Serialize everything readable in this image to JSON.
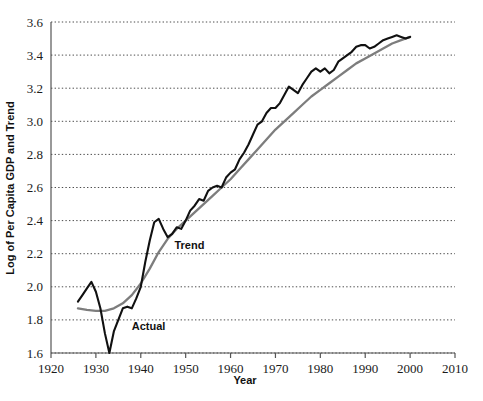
{
  "chart_data": {
    "type": "line",
    "title": "",
    "xlabel": "Year",
    "ylabel": "Log of Per Capita GDP and Trend",
    "xlim": [
      1920,
      2010
    ],
    "ylim": [
      1.6,
      3.6
    ],
    "xticks": [
      1920,
      1930,
      1940,
      1950,
      1960,
      1970,
      1980,
      1990,
      2000,
      2010
    ],
    "yticks": [
      1.6,
      1.8,
      2.0,
      2.2,
      2.4,
      2.6,
      2.8,
      3.0,
      3.2,
      3.4,
      3.6
    ],
    "xtick_labels": [
      "1920",
      "1930",
      "1940",
      "1950",
      "1960",
      "1970",
      "1980",
      "1990",
      "2000",
      "2010"
    ],
    "ytick_labels": [
      "1.6",
      "1.8",
      "2.0",
      "2.2",
      "2.4",
      "2.6",
      "2.8",
      "3.0",
      "3.2",
      "3.4",
      "3.6"
    ],
    "grid": true,
    "grid_axis": "y",
    "legend_position": "inline-annotation",
    "colors": {
      "actual": "#111111",
      "trend": "#7d7d7d",
      "grid": "#4d4d4d",
      "axis": "#555555"
    },
    "annotations": [
      {
        "name": "trend-label",
        "text": "Trend",
        "x": 1947.5,
        "y": 2.23
      },
      {
        "name": "actual-label",
        "text": "Actual",
        "x": 1938.0,
        "y": 1.74
      }
    ],
    "series": [
      {
        "name": "Actual",
        "color": "#111111",
        "x": [
          1926,
          1927,
          1928,
          1929,
          1930,
          1931,
          1932,
          1933,
          1934,
          1935,
          1936,
          1937,
          1938,
          1939,
          1940,
          1941,
          1942,
          1943,
          1944,
          1945,
          1946,
          1947,
          1948,
          1949,
          1950,
          1951,
          1952,
          1953,
          1954,
          1955,
          1956,
          1957,
          1958,
          1959,
          1960,
          1961,
          1962,
          1963,
          1964,
          1965,
          1966,
          1967,
          1968,
          1969,
          1970,
          1971,
          1972,
          1973,
          1974,
          1975,
          1976,
          1977,
          1978,
          1979,
          1980,
          1981,
          1982,
          1983,
          1984,
          1985,
          1986,
          1987,
          1988,
          1989,
          1990,
          1991,
          1992,
          1993,
          1994,
          1995,
          1996,
          1997,
          1998,
          1999,
          2000
        ],
        "values": [
          1.91,
          1.95,
          1.99,
          2.03,
          1.97,
          1.87,
          1.72,
          1.6,
          1.73,
          1.8,
          1.87,
          1.88,
          1.87,
          1.93,
          2.0,
          2.15,
          2.28,
          2.39,
          2.41,
          2.35,
          2.3,
          2.32,
          2.36,
          2.35,
          2.4,
          2.46,
          2.49,
          2.53,
          2.52,
          2.58,
          2.6,
          2.61,
          2.6,
          2.66,
          2.69,
          2.71,
          2.77,
          2.81,
          2.86,
          2.92,
          2.98,
          3.0,
          3.05,
          3.08,
          3.08,
          3.11,
          3.16,
          3.21,
          3.19,
          3.17,
          3.22,
          3.26,
          3.3,
          3.32,
          3.3,
          3.32,
          3.29,
          3.31,
          3.36,
          3.38,
          3.4,
          3.42,
          3.45,
          3.46,
          3.46,
          3.44,
          3.45,
          3.47,
          3.49,
          3.5,
          3.51,
          3.52,
          3.51,
          3.5,
          3.51
        ]
      },
      {
        "name": "Trend",
        "color": "#7d7d7d",
        "x": [
          1926,
          1928,
          1930,
          1932,
          1934,
          1936,
          1938,
          1940,
          1942,
          1944,
          1946,
          1948,
          1950,
          1952,
          1954,
          1956,
          1958,
          1960,
          1962,
          1964,
          1966,
          1968,
          1970,
          1972,
          1974,
          1976,
          1978,
          1980,
          1982,
          1984,
          1986,
          1988,
          1990,
          1992,
          1994,
          1996,
          1998,
          2000
        ],
        "values": [
          1.87,
          1.86,
          1.855,
          1.855,
          1.87,
          1.9,
          1.95,
          2.02,
          2.11,
          2.21,
          2.29,
          2.35,
          2.4,
          2.45,
          2.5,
          2.55,
          2.6,
          2.65,
          2.71,
          2.77,
          2.83,
          2.89,
          2.95,
          3.0,
          3.05,
          3.1,
          3.15,
          3.19,
          3.23,
          3.27,
          3.31,
          3.35,
          3.38,
          3.41,
          3.44,
          3.47,
          3.49,
          3.51
        ]
      }
    ]
  },
  "plot_geometry": {
    "left": 51,
    "right": 455,
    "top": 22,
    "bottom": 353
  }
}
